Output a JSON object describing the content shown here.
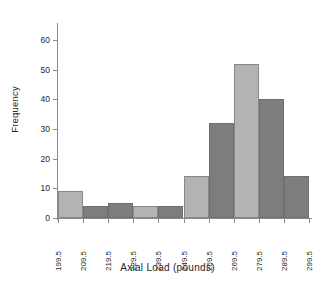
{
  "chart_data": {
    "type": "bar",
    "title": "",
    "subtitle": "",
    "xlabel": "Axial Load (pounds)",
    "ylabel": "Frequency",
    "grid": false,
    "legend": "none",
    "xlim": [
      199.5,
      299.5
    ],
    "ylim": [
      0,
      65
    ],
    "y_ticks": [
      0,
      10,
      20,
      30,
      40,
      50,
      60
    ],
    "x_tick_labels": [
      "199.5",
      "209.5",
      "219.5",
      "229.5",
      "239.5",
      "249.5",
      "259.5",
      "269.5",
      "279.5",
      "289.5",
      "299.5"
    ],
    "bin_edges": [
      199.5,
      209.5,
      219.5,
      229.5,
      239.5,
      249.5,
      259.5,
      269.5,
      279.5,
      289.5,
      299.5
    ],
    "categories": [
      "199.5-209.5",
      "209.5-219.5",
      "219.5-229.5",
      "229.5-239.5",
      "239.5-249.5",
      "249.5-259.5",
      "259.5-269.5",
      "269.5-279.5",
      "279.5-289.5",
      "289.5-299.5"
    ],
    "values": [
      9,
      4,
      5,
      4,
      4,
      14,
      32,
      52,
      40,
      14
    ],
    "bar_colors": [
      "#b3b3b3",
      "#7d7d7d",
      "#7d7d7d",
      "#b3b3b3",
      "#7d7d7d",
      "#b3b3b3",
      "#7d7d7d",
      "#b3b3b3",
      "#7d7d7d",
      "#7d7d7d"
    ],
    "colors": {
      "light_bar": "#b3b3b3",
      "dark_bar": "#7d7d7d",
      "axis": "#8a8a8a",
      "text": "#262626",
      "background": "#ffffff"
    }
  }
}
